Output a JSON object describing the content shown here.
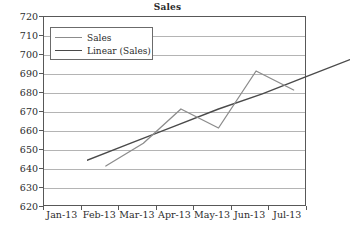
{
  "chart_data": {
    "type": "line",
    "title": "Sales",
    "xlabel": "",
    "ylabel": "",
    "categories": [
      "Jan-13",
      "Feb-13",
      "Mar-13",
      "Apr-13",
      "May-13",
      "Jun-13",
      "Jul-13"
    ],
    "ylim": [
      620,
      720
    ],
    "ytick_step": 10,
    "yticks": [
      620,
      630,
      640,
      650,
      660,
      670,
      680,
      690,
      700,
      710,
      720
    ],
    "grid": "horizontal",
    "legend_position": "top-left-inside",
    "series": [
      {
        "name": "Sales",
        "color": "#8c8c8c",
        "values": [
          650,
          662,
          680,
          670,
          700,
          690,
          null
        ]
      },
      {
        "name": "Linear (Sales)",
        "color": "#4a4a4a",
        "values": [
          653,
          662,
          671,
          680,
          688,
          697,
          706
        ]
      }
    ]
  },
  "legend": {
    "entries": [
      {
        "label": "Sales"
      },
      {
        "label": "Linear (Sales)"
      }
    ]
  },
  "colors": {
    "series_sales": "#8c8c8c",
    "series_trend": "#4a4a4a",
    "gridline": "#b4b4b4",
    "axis": "#585858",
    "text": "#2b2b2b",
    "background": "#ffffff"
  }
}
